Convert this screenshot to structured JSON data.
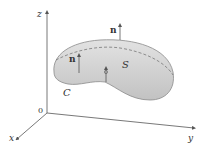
{
  "figure": {
    "type": "3D surface with boundary curve and normal vectors",
    "axes": {
      "x_label": "x",
      "y_label": "y",
      "z_label": "z",
      "origin_label": "0"
    },
    "surface_label": "S",
    "curve_label": "C",
    "normal_labels": [
      "n",
      "n"
    ],
    "colors": {
      "surface_fill": "#cfcfcf",
      "surface_edge": "#8a8a8a",
      "axis": "#555555",
      "dashed_line": "#777777",
      "text": "#333333"
    }
  }
}
